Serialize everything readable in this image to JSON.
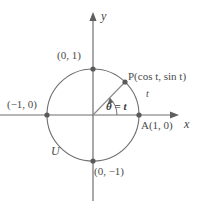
{
  "figure": {
    "kind": "unit-circle-diagram",
    "colors": {
      "stroke": "#6f6f6f",
      "text": "#4a4a4a",
      "background": "#ffffff",
      "point": "#5a5a5a"
    },
    "geometry": {
      "origin_x": 93,
      "origin_y": 115,
      "radius": 46,
      "point_p_angle_deg": 46
    }
  },
  "axes": {
    "x_label": "x",
    "y_label": "y"
  },
  "labels": {
    "point_p": "P(cos t, sin t)",
    "point_a": "A(1, 0)",
    "point_top": "(0, 1)",
    "point_bottom": "(0, −1)",
    "point_left": "(−1, 0)",
    "angle": "θ = t",
    "arc_length": "t",
    "circle_name": "U"
  }
}
